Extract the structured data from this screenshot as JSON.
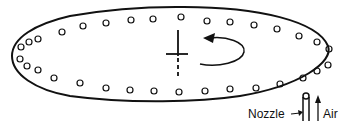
{
  "diagram": {
    "labels": {
      "nozzle": "Nozzle",
      "air": "Air"
    },
    "colors": {
      "stroke": "#111111",
      "background": "#ffffff"
    },
    "elements": [
      "elliptical-outline",
      "perimeter-holes",
      "center-axis-cross",
      "rotation-arrow",
      "nozzle",
      "air-arrow"
    ]
  }
}
